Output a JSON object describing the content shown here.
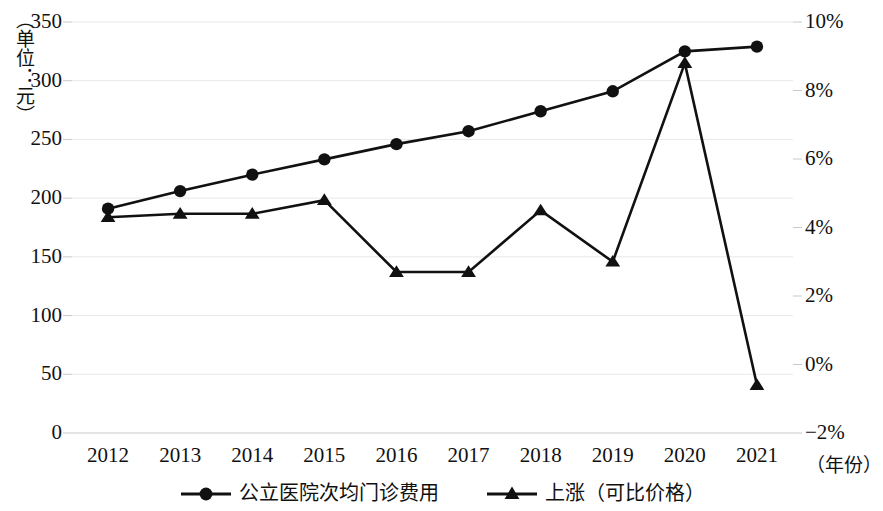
{
  "chart_data": {
    "type": "line",
    "title": "",
    "subtitle": "",
    "xlabel": "（年份）",
    "ylabel": "（单位：元）",
    "ylabel_right": "",
    "categories": [
      "2012",
      "2013",
      "2014",
      "2015",
      "2016",
      "2017",
      "2018",
      "2019",
      "2020",
      "2021"
    ],
    "x": [
      2012,
      2013,
      2014,
      2015,
      2016,
      2017,
      2018,
      2019,
      2020,
      2021
    ],
    "ylim": [
      0,
      350
    ],
    "ylim_right": [
      -2,
      10
    ],
    "ytick_labels": [
      "350",
      "300",
      "250",
      "200",
      "150",
      "100",
      "50",
      "0"
    ],
    "ytick_values": [
      350,
      300,
      250,
      200,
      150,
      100,
      50,
      0
    ],
    "ytick_right_labels": [
      "10%",
      "8%",
      "6%",
      "4%",
      "2%",
      "0%",
      "−2%"
    ],
    "ytick_right_values": [
      10,
      8,
      6,
      4,
      2,
      0,
      -2
    ],
    "grid": true,
    "legend_position": "bottom",
    "series": [
      {
        "name": "公立医院次均门诊费用",
        "axis": "left",
        "marker": "circle",
        "color": "#111111",
        "values": [
          191,
          206,
          220,
          233,
          246,
          257,
          274,
          291,
          325,
          329
        ]
      },
      {
        "name": "上涨（可比价格）",
        "axis": "right",
        "marker": "triangle",
        "color": "#111111",
        "values": [
          4.3,
          4.4,
          4.4,
          4.8,
          2.7,
          2.7,
          4.5,
          3.0,
          8.8,
          -0.6
        ]
      }
    ]
  },
  "legend": {
    "items": [
      {
        "label": "公立医院次均门诊费用",
        "marker": "circle-marker-icon"
      },
      {
        "label": "上涨（可比价格）",
        "marker": "triangle-marker-icon"
      }
    ]
  },
  "colors": {
    "ink": "#111111",
    "grid": "#e8e8e8",
    "axis": "#c9c9c9",
    "background": "#ffffff"
  }
}
